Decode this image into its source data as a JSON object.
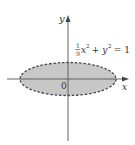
{
  "diagram": {
    "equation": {
      "frac_num": "1",
      "frac_den": "9",
      "x_var": "x",
      "exp1": "2",
      "plus": " + y",
      "exp2": "2",
      "rhs": " = 1"
    },
    "axes": {
      "x_label": "x",
      "y_label": "y",
      "origin_label": "0"
    },
    "colors": {
      "fill": "#c8c8c8",
      "stroke": "#444444",
      "axis": "#555555"
    }
  }
}
